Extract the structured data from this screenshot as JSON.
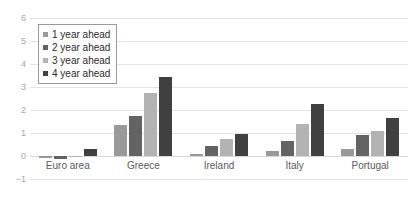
{
  "chart_data": {
    "type": "bar",
    "title": "",
    "subtitle": "",
    "xlabel": "",
    "ylabel": "",
    "categories": [
      "Euro area",
      "Greece",
      "Ireland",
      "Italy",
      "Portugal"
    ],
    "series": [
      {
        "name": "1 year ahead",
        "color": "#999999",
        "values": [
          -0.1,
          1.35,
          0.1,
          0.2,
          0.3
        ]
      },
      {
        "name": "2 year ahead",
        "color": "#636363",
        "values": [
          -0.15,
          1.72,
          0.45,
          0.65,
          0.9
        ]
      },
      {
        "name": "3 year ahead",
        "color": "#b3b3b3",
        "values": [
          -0.05,
          2.75,
          0.75,
          1.4,
          1.1
        ]
      },
      {
        "name": "4 year ahead",
        "color": "#404040",
        "values": [
          0.3,
          3.45,
          0.95,
          2.25,
          1.65
        ]
      }
    ],
    "ylim": [
      -1,
      6
    ],
    "yticks": [
      6,
      5,
      4,
      3,
      2,
      1,
      0,
      -1
    ],
    "ytick_labels": [
      "6",
      "5",
      "4",
      "3",
      "2",
      "1",
      "0",
      "−1"
    ],
    "grid": true,
    "legend_position": "top-left",
    "legend_entries": [
      "1 year ahead",
      "2 year ahead",
      "3 year ahead",
      "4 year ahead"
    ]
  }
}
